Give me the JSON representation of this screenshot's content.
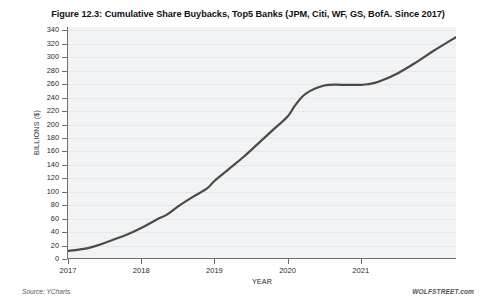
{
  "figure": {
    "source_note": "Source: YCharts",
    "brand_note": "WOLFSTREET.com"
  },
  "chart_data": {
    "type": "line",
    "title": "Figure 12.3: Cumulative Share Buybacks, Top5 Banks (JPM, Citi, WF, GS, BofA. Since 2017)",
    "xlabel": "YEAR",
    "ylabel": "BILLIONS ($)",
    "xlim": [
      2017.0,
      2022.3
    ],
    "ylim": [
      0,
      345
    ],
    "grid": true,
    "legend": "none",
    "x_tick_labels": [
      "2017",
      "2018",
      "2019",
      "2020",
      "2021"
    ],
    "x_tick_values": [
      2017,
      2018,
      2019,
      2020,
      2021
    ],
    "y_tick_labels": [
      "0",
      "20",
      "40",
      "60",
      "80",
      "100",
      "120",
      "140",
      "160",
      "180",
      "200",
      "220",
      "240",
      "260",
      "280",
      "300",
      "320",
      "340"
    ],
    "y_tick_values": [
      0,
      20,
      40,
      60,
      80,
      100,
      120,
      140,
      160,
      180,
      200,
      220,
      240,
      260,
      280,
      300,
      320,
      340
    ],
    "line_color": "#4a4a4a",
    "line_width": 2.2,
    "series": [
      {
        "name": "Cumulative Share Buybacks, Top 5 Banks",
        "x": [
          2017.0,
          2017.15,
          2017.3,
          2017.45,
          2017.6,
          2017.8,
          2018.0,
          2018.2,
          2018.35,
          2018.5,
          2018.7,
          2018.9,
          2019.0,
          2019.2,
          2019.4,
          2019.6,
          2019.8,
          2020.0,
          2020.1,
          2020.25,
          2020.5,
          2020.75,
          2021.0,
          2021.1,
          2021.25,
          2021.5,
          2021.75,
          2022.0,
          2022.3
        ],
        "y": [
          12,
          14,
          17,
          22,
          28,
          36,
          46,
          58,
          66,
          78,
          92,
          105,
          116,
          134,
          152,
          172,
          192,
          212,
          228,
          246,
          258,
          259,
          259,
          260,
          264,
          276,
          292,
          310,
          330
        ]
      }
    ]
  }
}
